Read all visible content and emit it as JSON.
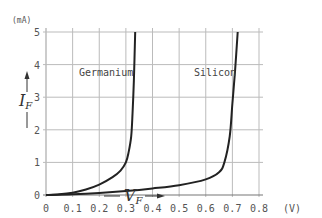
{
  "chart_data": {
    "type": "line",
    "title": "",
    "xlabel": "V_F",
    "ylabel": "I_F",
    "x_unit": "(V)",
    "y_unit": "(mA)",
    "xlim": [
      0,
      0.8
    ],
    "ylim": [
      0,
      5
    ],
    "grid": true,
    "legend": "inline labels",
    "x_ticks": [
      "0",
      "0.1",
      "0.2",
      "0.3",
      "0.4",
      "0.5",
      "0.6",
      "0.7",
      "0.8"
    ],
    "y_ticks": [
      "0",
      "1",
      "2",
      "3",
      "4",
      "5"
    ],
    "series": [
      {
        "name": "Germanium",
        "x": [
          0,
          0.05,
          0.1,
          0.15,
          0.2,
          0.25,
          0.28,
          0.3,
          0.31,
          0.32,
          0.325,
          0.33,
          0.335
        ],
        "y": [
          0,
          0.02,
          0.07,
          0.17,
          0.32,
          0.55,
          0.75,
          1.0,
          1.3,
          1.8,
          2.5,
          3.5,
          5.0
        ]
      },
      {
        "name": "Silicon",
        "x": [
          0,
          0.1,
          0.2,
          0.3,
          0.4,
          0.5,
          0.6,
          0.65,
          0.67,
          0.69,
          0.7,
          0.71,
          0.72
        ],
        "y": [
          0,
          0.02,
          0.06,
          0.12,
          0.2,
          0.3,
          0.48,
          0.7,
          1.0,
          1.8,
          2.8,
          3.8,
          5.0
        ]
      }
    ],
    "annotations": [
      {
        "text": "Germanium",
        "x": 0.21,
        "y": 3.3
      },
      {
        "text": "Silicon",
        "x": 0.6,
        "y": 3.3
      }
    ]
  },
  "labels": {
    "y_unit": "(mA)",
    "x_unit": "(V)",
    "germanium": "Germanium",
    "silicon": "Silicon",
    "y_axis_main": "I",
    "y_axis_sub": "F",
    "x_axis_main": "V",
    "x_axis_sub": "F"
  }
}
